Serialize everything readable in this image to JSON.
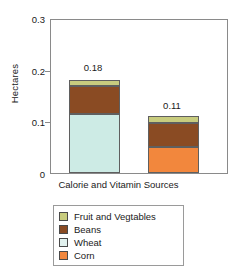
{
  "chart_data": {
    "type": "bar",
    "subtype": "stacked-bar",
    "title": "",
    "xlabel": "Calorie and Vitamin Sources",
    "ylabel": "Hectares",
    "ylim": [
      0,
      0.3
    ],
    "yticks": [
      "0.3",
      "0.2",
      "0.1",
      "0"
    ],
    "ytick_values": [
      0.3,
      0.2,
      0.1,
      0
    ],
    "grid": false,
    "legend_position": "below-plot",
    "categories": [
      "Bar 1",
      "Bar 2"
    ],
    "series": [
      {
        "name": "Fruit and Vegtables",
        "color": "#c8cc7e",
        "values": [
          0.012,
          0.013
        ]
      },
      {
        "name": "Beans",
        "color": "#8a4b23",
        "values": [
          0.053,
          0.047
        ]
      },
      {
        "name": "Wheat",
        "color": "#cdebe5",
        "values": [
          0.115,
          0
        ]
      },
      {
        "name": "Corn",
        "color": "#f2873d",
        "values": [
          0,
          0.05
        ]
      }
    ],
    "bar_totals": [
      0.18,
      0.11
    ],
    "bar_total_labels": [
      "0.18",
      "0.11"
    ]
  },
  "axes": {
    "y_title": "Hectares",
    "x_title": "Calorie and Vitamin Sources",
    "y_ticks": [
      {
        "label": "0.3",
        "value": 0.3
      },
      {
        "label": "0.2",
        "value": 0.2
      },
      {
        "label": "0.1",
        "value": 0.1
      },
      {
        "label": "0",
        "value": 0
      }
    ]
  },
  "bars": [
    {
      "total_label": "0.18",
      "segments": [
        {
          "name": "Fruit and Vegtables",
          "value": 0.012
        },
        {
          "name": "Beans",
          "value": 0.053
        },
        {
          "name": "Wheat",
          "value": 0.115
        }
      ]
    },
    {
      "total_label": "0.11",
      "segments": [
        {
          "name": "Fruit and Vegtables",
          "value": 0.013
        },
        {
          "name": "Beans",
          "value": 0.047
        },
        {
          "name": "Corn",
          "value": 0.05
        }
      ]
    }
  ],
  "legend": {
    "items": [
      {
        "label": "Fruit and Vegtables",
        "color": "#c8cc7e"
      },
      {
        "label": "Beans",
        "color": "#8a4b23"
      },
      {
        "label": "Wheat",
        "color": "#e2f2ef"
      },
      {
        "label": "Corn",
        "color": "#f2873d"
      }
    ]
  },
  "colors": {
    "fruit_and_vegtables": "#c8cc7e",
    "beans": "#8a4b23",
    "wheat": "#cdebe5",
    "corn": "#f2873d",
    "frame": "#8a8a8a",
    "text": "#1a1a1a"
  }
}
